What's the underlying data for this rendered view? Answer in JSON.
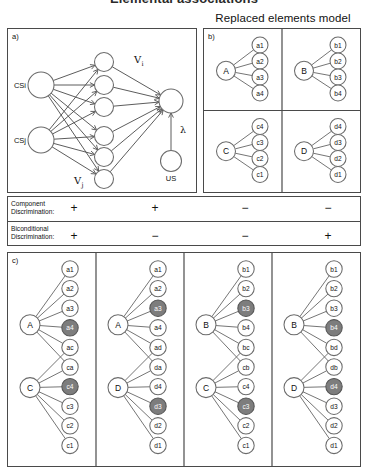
{
  "header": {
    "cropped_title": "Elemental associations",
    "model_title": "Replaced elements model"
  },
  "panel_a": {
    "tag": "a)",
    "input_nodes": [
      {
        "id": "csi",
        "label": "CSi"
      },
      {
        "id": "csj",
        "label": "CSj"
      }
    ],
    "element_node_count": 6,
    "output_node": {
      "label": ""
    },
    "us_node": {
      "label": "US"
    },
    "weight_label_v": "V",
    "weight_label_v_sub": "i",
    "weight_label_vj": "V",
    "weight_label_vj_sub": "j",
    "lambda_label": "λ"
  },
  "panel_b": {
    "tag": "b)",
    "quadrants": [
      {
        "parent": "A",
        "elements": [
          "a1",
          "a2",
          "a3",
          "a4"
        ]
      },
      {
        "parent": "B",
        "elements": [
          "b1",
          "b2",
          "b3",
          "b4"
        ]
      },
      {
        "parent": "C",
        "elements": [
          "c4",
          "c3",
          "c2",
          "c1"
        ]
      },
      {
        "parent": "D",
        "elements": [
          "d4",
          "d3",
          "d2",
          "d1"
        ]
      }
    ]
  },
  "table": {
    "row1_label": "Component\nDiscrimination:",
    "row2_label": "Biconditional\nDiscrimination:",
    "row1_values": [
      "+",
      "+",
      "−",
      "−"
    ],
    "row2_values": [
      "+",
      "−",
      "−",
      "+"
    ]
  },
  "panel_c": {
    "tag": "c)",
    "columns": [
      {
        "parents": [
          "A",
          "C"
        ],
        "elements": [
          "a1",
          "a2",
          "a3",
          "a4",
          "ac",
          "ca",
          "c4",
          "c3",
          "c2",
          "c1"
        ],
        "shaded": [
          "a4",
          "c4"
        ]
      },
      {
        "parents": [
          "A",
          "D"
        ],
        "elements": [
          "a1",
          "a2",
          "a3",
          "a4",
          "ad",
          "da",
          "d4",
          "d3",
          "d2",
          "d1"
        ],
        "shaded": [
          "a3",
          "d3"
        ]
      },
      {
        "parents": [
          "B",
          "C"
        ],
        "elements": [
          "b1",
          "b2",
          "b3",
          "b4",
          "bc",
          "cb",
          "c4",
          "c3",
          "c2",
          "c1"
        ],
        "shaded": [
          "b3",
          "c3"
        ]
      },
      {
        "parents": [
          "B",
          "D"
        ],
        "elements": [
          "b1",
          "b2",
          "b3",
          "b4",
          "bd",
          "db",
          "d4",
          "d3",
          "d2",
          "d1"
        ],
        "shaded": [
          "b4",
          "d4"
        ]
      }
    ]
  },
  "colors": {
    "shaded_node": "#7d7d7d",
    "node_stroke": "#6b6b6b",
    "panel_border": "#4a4a4a",
    "link": "#6e6e6e",
    "background": "#ffffff"
  }
}
